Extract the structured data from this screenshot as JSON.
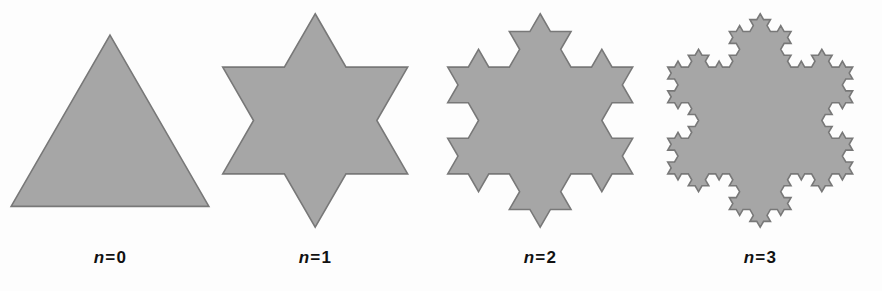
{
  "figure": {
    "name": "koch-snowflake-iterations",
    "background_color": "#fdfdfd",
    "fill_color": "#a6a6a6",
    "stroke_color": "#787878",
    "stroke_width": 1.6,
    "label_color": "#111111"
  },
  "panels": [
    {
      "id": "koch-n0",
      "iterations": 0,
      "label": "n = 0",
      "label_var": "n",
      "label_eq": "=",
      "label_value": "0",
      "shape_name": "equilateral-triangle",
      "left": 0,
      "side": 168,
      "scale": 1.0
    },
    {
      "id": "koch-n1",
      "iterations": 1,
      "label": "n = 1",
      "label_var": "n",
      "label_eq": "=",
      "label_value": "1",
      "shape_name": "six-pointed-star",
      "left": 205,
      "side": 168,
      "scale": 1.0
    },
    {
      "id": "koch-n2",
      "iterations": 2,
      "label": "n = 2",
      "label_var": "n",
      "label_eq": "=",
      "label_value": "2",
      "shape_name": "koch-snowflake-stage-2",
      "left": 430,
      "side": 168,
      "scale": 1.0
    },
    {
      "id": "koch-n3",
      "iterations": 3,
      "label": "n = 3",
      "label_var": "n",
      "label_eq": "=",
      "label_value": "3",
      "shape_name": "koch-snowflake-stage-3",
      "left": 650,
      "side": 168,
      "scale": 1.0
    }
  ],
  "chart_data": {
    "type": "diagram",
    "title": "",
    "subtitle": "",
    "diagram_kind": "koch-snowflake-construction",
    "categories": [
      "n = 0",
      "n = 1",
      "n = 2",
      "n = 3"
    ],
    "iterations": [
      0,
      1,
      2,
      3
    ],
    "segments_per_stage": [
      3,
      12,
      48,
      192
    ],
    "relative_perimeter": [
      1,
      1.3333,
      1.7778,
      2.3704
    ],
    "base_triangle_side_px": 168,
    "fill_color": "#a6a6a6",
    "stroke_color": "#787878",
    "legend": [],
    "xlabel": "",
    "ylabel": "",
    "grid": false
  }
}
